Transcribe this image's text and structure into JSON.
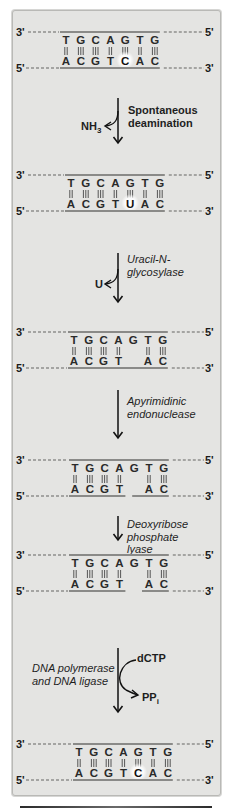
{
  "strand_labels": {
    "top_left": "3'",
    "top_right": "5'",
    "bottom_left": "5'",
    "bottom_right": "3'"
  },
  "top_sequence": [
    "T",
    "G",
    "C",
    "A",
    "G",
    "T",
    "G"
  ],
  "pair_bonds": [
    2,
    3,
    3,
    2,
    3,
    2,
    3
  ],
  "stages": [
    {
      "id": "original",
      "bottom": [
        "A",
        "C",
        "G",
        "T",
        "C",
        "A",
        "C"
      ],
      "highlight": 4,
      "gap": false,
      "nick": false
    },
    {
      "id": "deaminated",
      "bottom": [
        "A",
        "C",
        "G",
        "T",
        "U",
        "A",
        "C"
      ],
      "highlight": 4,
      "gap": false,
      "nick": false
    },
    {
      "id": "abasic",
      "bottom": [
        "A",
        "C",
        "G",
        "T",
        "",
        "A",
        "C"
      ],
      "highlight": -1,
      "gap": false,
      "nick": false
    },
    {
      "id": "nicked",
      "bottom": [
        "A",
        "C",
        "G",
        "T",
        "",
        "A",
        "C"
      ],
      "highlight": -1,
      "gap": false,
      "nick": true
    },
    {
      "id": "gapped",
      "bottom": [
        "A",
        "C",
        "G",
        "T",
        "",
        "A",
        "C"
      ],
      "highlight": -1,
      "gap": true,
      "nick": false
    },
    {
      "id": "repaired",
      "bottom": [
        "A",
        "C",
        "G",
        "T",
        "C",
        "A",
        "C"
      ],
      "highlight": 4,
      "gap": false,
      "nick": false
    }
  ],
  "steps": [
    {
      "enzyme_lines": [
        "Spontaneous",
        "deamination"
      ],
      "enzyme_style": "bold",
      "side_in": "",
      "side_out": "NH3",
      "side_out_main": "NH",
      "side_out_sub": "3"
    },
    {
      "enzyme_lines": [
        "Uracil-N-",
        "glycosylase"
      ],
      "enzyme_style": "italic",
      "side_in": "",
      "side_out": "U",
      "side_out_main": "U",
      "side_out_sub": ""
    },
    {
      "enzyme_lines": [
        "Apyrimidinic",
        "endonuclease"
      ],
      "enzyme_style": "italic",
      "side_in": "",
      "side_out": "",
      "side_out_main": "",
      "side_out_sub": ""
    },
    {
      "enzyme_lines": [
        "Deoxyribose",
        "phosphate",
        "lyase"
      ],
      "enzyme_style": "italic",
      "side_in": "",
      "side_out": "",
      "side_out_main": "",
      "side_out_sub": ""
    },
    {
      "enzyme_lines": [
        "DNA polymerase",
        "and DNA ligase"
      ],
      "enzyme_style": "italic",
      "side_in": "dCTP",
      "side_out": "PPi",
      "side_out_main": "PP",
      "side_out_sub": "i"
    }
  ],
  "colors": {
    "panel_bg": "#e4e4e2",
    "backbone": "#8a8a88",
    "dashed": "#8f8f8d",
    "bond": "#555555",
    "highlight_glow": "#ffffff"
  }
}
